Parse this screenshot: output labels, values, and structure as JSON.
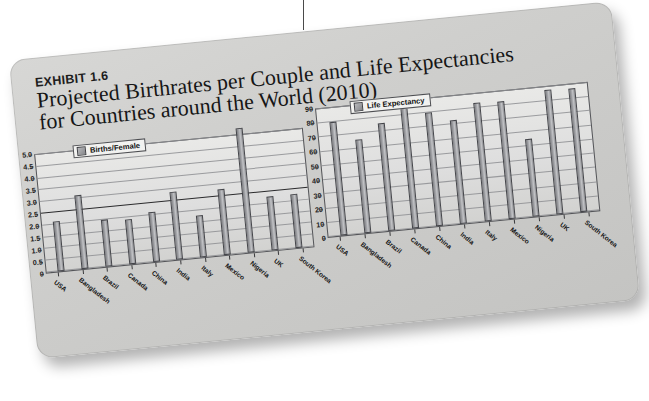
{
  "exhibit": {
    "number_label": "EXHIBIT 1.6",
    "title_line1": "Projected Birthrates per Couple and Life Expectancies",
    "title_line2": "for Countries around the World (2010)"
  },
  "countries": [
    "USA",
    "Bangladesh",
    "Brazil",
    "Canada",
    "China",
    "India",
    "Italy",
    "Mexico",
    "Nigeria",
    "UK",
    "South Korea"
  ],
  "colors": {
    "card_background": "#d2d2d0",
    "panel_background": "#e0e0de",
    "bar_fill": "#9a9b9f",
    "bar_stroke": "#44454a",
    "gridline": "#8d8e92",
    "text": "#161616"
  },
  "chart_data": [
    {
      "type": "bar",
      "id": "births-per-female",
      "title": "",
      "legend": [
        "Births/Female"
      ],
      "legend_position": "top-left",
      "grid": true,
      "xlabel": "",
      "ylabel": "",
      "ylim": [
        0,
        5.0
      ],
      "yticks": [
        "0",
        "0.5",
        "1.0",
        "1.5",
        "2.0",
        "2.5",
        "3.0",
        "3.5",
        "4.0",
        "4.5",
        "5.0"
      ],
      "categories": [
        "USA",
        "Bangladesh",
        "Brazil",
        "Canada",
        "China",
        "India",
        "Italy",
        "Mexico",
        "Nigeria",
        "UK",
        "South Korea"
      ],
      "values": [
        2.1,
        3.15,
        2.0,
        1.9,
        2.1,
        2.9,
        1.8,
        2.8,
        5.3,
        2.3,
        2.3
      ]
    },
    {
      "type": "bar",
      "id": "life-expectancy",
      "title": "",
      "legend": [
        "Life Expectancy"
      ],
      "legend_position": "top-left",
      "grid": true,
      "xlabel": "",
      "ylabel": "",
      "ylim": [
        0,
        90
      ],
      "yticks": [
        "0",
        "10",
        "20",
        "30",
        "40",
        "50",
        "60",
        "70",
        "80",
        "90"
      ],
      "categories": [
        "USA",
        "Bangladesh",
        "Brazil",
        "Canada",
        "China",
        "India",
        "Italy",
        "Mexico",
        "Nigeria",
        "UK",
        "South Korea"
      ],
      "values": [
        80,
        66,
        76,
        85,
        80,
        73,
        84,
        83,
        55,
        88,
        87
      ]
    }
  ]
}
